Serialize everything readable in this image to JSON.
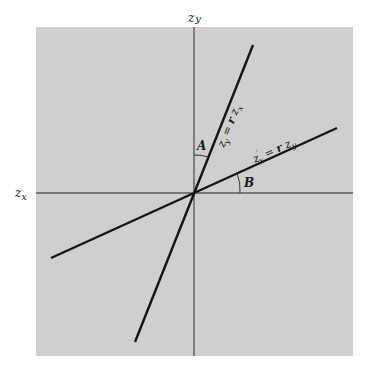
{
  "diagram": {
    "type": "regression-lines-standardized",
    "background_color": "#cfcfcf",
    "line_color": "#141414",
    "axis_color": "#555555",
    "axes": {
      "horizontal": {
        "label_main": "z",
        "label_sub": "x"
      },
      "vertical": {
        "label_main": "z",
        "label_sub": "y"
      }
    },
    "lines": [
      {
        "id": "steep",
        "equation": {
          "lhs_main": "z",
          "lhs_prime": "′",
          "lhs_sub": "y",
          "eq": " = ",
          "r": "r",
          "rhs_main": " z",
          "rhs_sub": "x"
        },
        "from": [
          135,
          342
        ],
        "to": [
          253,
          45
        ]
      },
      {
        "id": "shallow",
        "equation": {
          "lhs_main": "z",
          "lhs_prime": "′",
          "lhs_sub": "x",
          "eq": " = ",
          "r": "r",
          "rhs_main": " z",
          "rhs_sub": "y"
        },
        "from": [
          51,
          258
        ],
        "to": [
          337,
          128
        ]
      }
    ],
    "angles": [
      {
        "label": "A",
        "between": "vertical axis and steep line"
      },
      {
        "label": "B",
        "between": "horizontal axis and shallow line"
      }
    ],
    "origin": [
      194,
      193
    ]
  }
}
